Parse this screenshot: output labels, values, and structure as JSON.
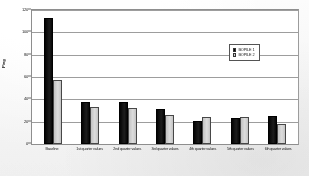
{
  "chart_data": {
    "type": "bar",
    "title": "",
    "xlabel": "",
    "ylabel": "Ping",
    "ylim": [
      0,
      120
    ],
    "yticks": [
      0,
      20,
      40,
      60,
      80,
      100,
      120
    ],
    "grid": true,
    "legend_position": "upper-right",
    "categories": [
      "Baseline",
      "1st quarter values",
      "2nd quarter values",
      "3rd quarter values",
      "4th quarter values",
      "5th quarter values",
      "6th quarter values"
    ],
    "series": [
      {
        "name": "BOPILE 1",
        "color": "#111111",
        "values": [
          113,
          38,
          38,
          31,
          21,
          23,
          25
        ]
      },
      {
        "name": "BOPILE 2",
        "color": "#c9c9c7",
        "values": [
          57,
          33,
          32,
          26,
          24,
          24,
          18
        ]
      }
    ]
  },
  "legend": {
    "entries": [
      {
        "label": "BOPILE 1"
      },
      {
        "label": "BOPILE 2"
      }
    ]
  },
  "axis": {
    "y_title": "Ping",
    "ticks": [
      "120",
      "100",
      "80",
      "60",
      "40",
      "20",
      "0"
    ]
  }
}
